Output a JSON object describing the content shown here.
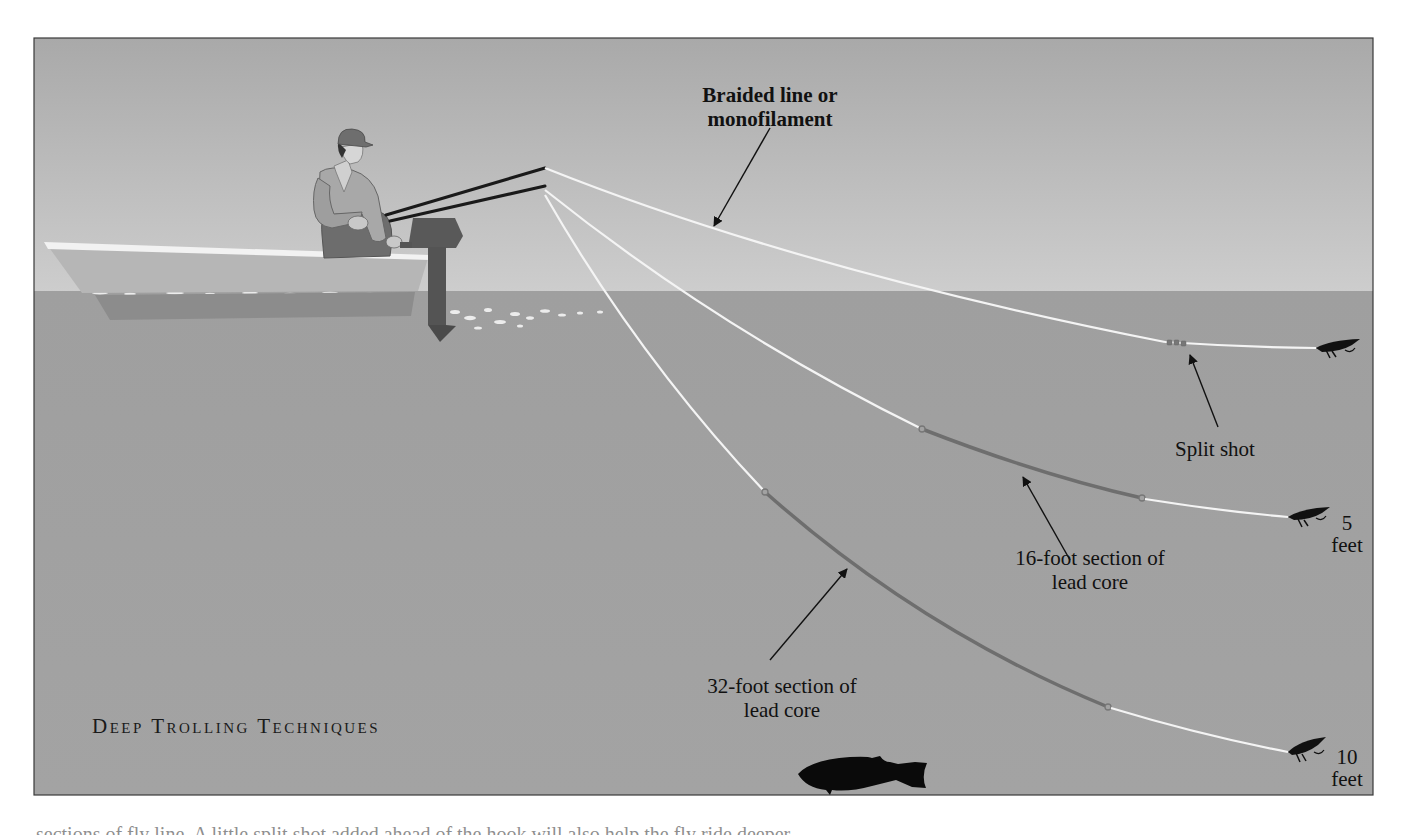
{
  "figure": {
    "title": "Deep Trolling Techniques",
    "colors": {
      "sky_top": "#a9a9a9",
      "sky_horizon": "#cdcdcd",
      "water": "#a2a2a2",
      "line_mono": "#f4f4f4",
      "lead_core": "#6e6e6e",
      "arrow": "#111111",
      "fly": "#111111",
      "frame": "#3a3a3a"
    },
    "labels": {
      "braided": [
        "Braided line or",
        "monofilament"
      ],
      "split_shot": "Split shot",
      "sixteen_foot": [
        "16-foot section of",
        "lead core"
      ],
      "thirtytwo_foot": [
        "32-foot section of",
        "lead core"
      ]
    },
    "depths": [
      {
        "value": "5",
        "unit": "feet"
      },
      {
        "value": "10",
        "unit": "feet"
      }
    ],
    "rigs": [
      {
        "name": "surface-line",
        "description": "Braided line or monofilament with split shot"
      },
      {
        "name": "5-foot-line",
        "description": "16-foot section of lead core",
        "depth": "5 feet"
      },
      {
        "name": "10-foot-line",
        "description": "32-foot section of lead core",
        "depth": "10 feet"
      }
    ],
    "icons": [
      "angler",
      "boat",
      "outboard-motor",
      "fishing-rod",
      "streamer-fly",
      "fish",
      "arrow"
    ]
  },
  "caption": {
    "text": "sections of fly line. A little split shot added ahead of the hook will also help the fly ride deeper."
  }
}
